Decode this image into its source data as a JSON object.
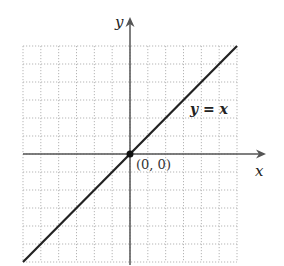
{
  "chart_data": {
    "type": "line",
    "title": "",
    "xlabel": "x",
    "ylabel": "y",
    "xlim": [
      -6,
      6
    ],
    "ylim": [
      -6,
      6
    ],
    "grid": true,
    "grid_style": "dotted",
    "legend": null,
    "series": [
      {
        "name": "y = x",
        "x": [
          -6,
          6
        ],
        "y": [
          -6,
          6
        ],
        "color": "#222222"
      }
    ],
    "annotations": [
      {
        "text": "(0, 0)",
        "x": 0,
        "y": 0,
        "marker": "filled-circle"
      },
      {
        "text": "y = x",
        "x": 3.4,
        "y": 2.5
      }
    ]
  },
  "labels": {
    "x_axis": "x",
    "y_axis": "y",
    "line": "y = x",
    "origin": "(0, 0)"
  },
  "colors": {
    "line": "#222222",
    "axis": "#555555",
    "grid": "#b5b5b5",
    "point": "#111111"
  }
}
